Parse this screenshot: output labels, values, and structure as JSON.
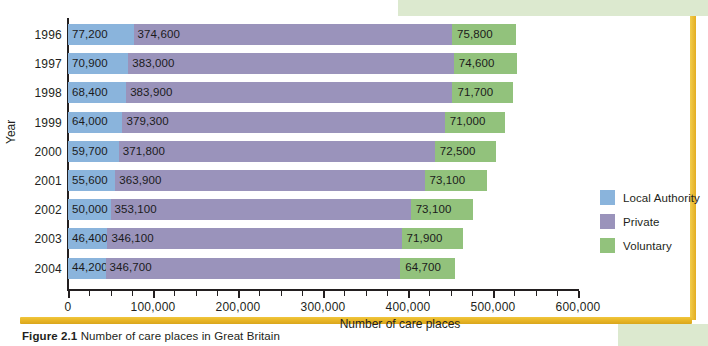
{
  "figure": {
    "caption_prefix": "Figure 2.1",
    "caption_text": "Number of care places in Great Britain",
    "y_axis_title": "Year",
    "x_axis_title": "Number of care places"
  },
  "legend": {
    "items": [
      {
        "label": "Local Authority",
        "color": "#8ab4dc",
        "key": "local_authority"
      },
      {
        "label": "Private",
        "color": "#9a93bb",
        "key": "private"
      },
      {
        "label": "Voluntary",
        "color": "#92c27c",
        "key": "voluntary"
      }
    ]
  },
  "chart_data": {
    "type": "bar",
    "orientation": "horizontal",
    "stacked": true,
    "title": "",
    "xlabel": "Number of care places",
    "ylabel": "Year",
    "xlim": [
      0,
      600000
    ],
    "xticks": [
      0,
      100000,
      200000,
      300000,
      400000,
      500000,
      600000
    ],
    "xtick_labels": [
      "0",
      "100,000",
      "200,000",
      "300,000",
      "400,000",
      "500,000",
      "600,000"
    ],
    "minor_tick_interval": 25000,
    "grid": false,
    "legend_position": "right",
    "categories": [
      "1996",
      "1997",
      "1998",
      "1999",
      "2000",
      "2001",
      "2002",
      "2003",
      "2004"
    ],
    "series": [
      {
        "name": "Local Authority",
        "color": "#8ab4dc",
        "values": [
          77200,
          70900,
          68400,
          64000,
          59700,
          55600,
          50000,
          46400,
          44200
        ],
        "labels": [
          "77,200",
          "70,900",
          "68,400",
          "64,000",
          "59,700",
          "55,600",
          "50,000",
          "46,400",
          "44,200"
        ]
      },
      {
        "name": "Private",
        "color": "#9a93bb",
        "values": [
          374600,
          383000,
          383900,
          379300,
          371800,
          363900,
          353100,
          346100,
          346700
        ],
        "labels": [
          "374,600",
          "383,000",
          "383,900",
          "379,300",
          "371,800",
          "363,900",
          "353,100",
          "346,100",
          "346,700"
        ]
      },
      {
        "name": "Voluntary",
        "color": "#92c27c",
        "values": [
          75800,
          74600,
          71700,
          71000,
          72500,
          73100,
          73100,
          71900,
          64700
        ],
        "labels": [
          "75,800",
          "74,600",
          "71,700",
          "71,000",
          "72,500",
          "73,100",
          "73,100",
          "71,900",
          "64,700"
        ]
      }
    ]
  }
}
